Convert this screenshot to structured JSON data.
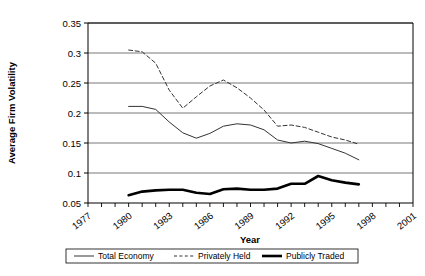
{
  "chart_data": {
    "type": "line",
    "title": "",
    "xlabel": "Year",
    "ylabel": "Average Firm Volatility",
    "xlim": [
      1977,
      2001
    ],
    "ylim": [
      0.05,
      0.35
    ],
    "ytick_labels": [
      "0.35",
      "0.3",
      "0.25",
      "0.2",
      "0.15",
      "0.1",
      "0.05"
    ],
    "ytick_values": [
      0.35,
      0.3,
      0.25,
      0.2,
      0.15,
      0.1,
      0.05
    ],
    "xtick_labels": [
      "1977",
      "1980",
      "1983",
      "1986",
      "1989",
      "1992",
      "1995",
      "1998",
      "2001"
    ],
    "xtick_values": [
      1977,
      1980,
      1983,
      1986,
      1989,
      1992,
      1995,
      2001
    ],
    "minor_tick_step": 1,
    "grid": "horizontal",
    "legend_position": "bottom",
    "series": [
      {
        "name": "Total Economy",
        "style": "solid-thin",
        "color": "#000000",
        "width": 1,
        "x": [
          1980,
          1981,
          1982,
          1983,
          1984,
          1985,
          1986,
          1987,
          1988,
          1989,
          1990,
          1991,
          1992,
          1993,
          1994,
          1995,
          1996,
          1997
        ],
        "values": [
          0.211,
          0.211,
          0.206,
          0.185,
          0.167,
          0.158,
          0.166,
          0.178,
          0.182,
          0.18,
          0.172,
          0.155,
          0.15,
          0.153,
          0.149,
          0.141,
          0.133,
          0.122
        ]
      },
      {
        "name": "Privately Held",
        "style": "dashed",
        "color": "#000000",
        "width": 1,
        "x": [
          1980,
          1981,
          1982,
          1983,
          1984,
          1985,
          1986,
          1987,
          1988,
          1989,
          1990,
          1991,
          1992,
          1993,
          1994,
          1995,
          1996,
          1997
        ],
        "values": [
          0.305,
          0.302,
          0.283,
          0.238,
          0.208,
          0.227,
          0.245,
          0.255,
          0.242,
          0.225,
          0.205,
          0.178,
          0.18,
          0.176,
          0.168,
          0.16,
          0.155,
          0.148
        ]
      },
      {
        "name": "Publicly Traded",
        "style": "solid-thick",
        "color": "#000000",
        "width": 2.6,
        "x": [
          1980,
          1981,
          1982,
          1983,
          1984,
          1985,
          1986,
          1987,
          1988,
          1989,
          1990,
          1991,
          1992,
          1993,
          1994,
          1995,
          1996,
          1997
        ],
        "values": [
          0.063,
          0.069,
          0.071,
          0.072,
          0.072,
          0.067,
          0.065,
          0.073,
          0.074,
          0.072,
          0.072,
          0.074,
          0.082,
          0.082,
          0.095,
          0.088,
          0.084,
          0.081
        ]
      }
    ]
  },
  "legend": {
    "items": [
      {
        "label": "Total Economy",
        "style": "solid-thin"
      },
      {
        "label": "Privately Held",
        "style": "dashed"
      },
      {
        "label": "Publicly Traded",
        "style": "solid-thick"
      }
    ]
  },
  "axis": {
    "x_title": "Year",
    "y_title": "Average Firm Volatility"
  }
}
